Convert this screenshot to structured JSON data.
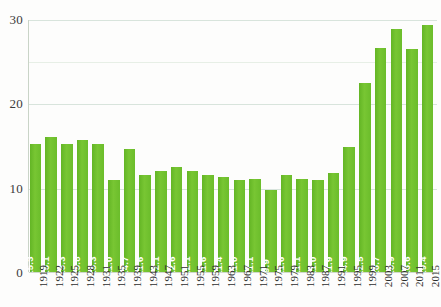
{
  "chart_data": {
    "type": "bar",
    "title": "",
    "xlabel": "",
    "ylabel": "",
    "ylim": [
      0,
      30
    ],
    "yticks": [
      0,
      10,
      20,
      30
    ],
    "ytick_labels": [
      "0",
      "10",
      "20",
      "30"
    ],
    "extra_gridlines": [
      25
    ],
    "grid": true,
    "legend": "none",
    "bar_color": "#6cbe2a",
    "bar_label_color": "#ffffff",
    "axis_text_color": "#2e2e2e",
    "categories": [
      "1919",
      "1922",
      "1925",
      "1928",
      "1931",
      "1935",
      "1939",
      "1943",
      "1947",
      "1951",
      "1955",
      "1959",
      "1963",
      "1967",
      "1971",
      "1975",
      "1979",
      "1983",
      "1987",
      "1991",
      "1995",
      "1999",
      "2003",
      "2007",
      "2011",
      "2015"
    ],
    "values": [
      15.3,
      16.1,
      15.3,
      15.8,
      15.3,
      11.0,
      14.7,
      11.6,
      12.1,
      12.6,
      12.1,
      11.6,
      11.4,
      11.0,
      11.1,
      9.9,
      11.6,
      11.1,
      11.0,
      11.9,
      14.9,
      22.5,
      26.7,
      28.9,
      26.6,
      29.4
    ],
    "value_labels": [
      "15.3",
      "16.1",
      "15.3",
      "15.8",
      "15.3",
      "11.0",
      "14.7",
      "11.6",
      "12.1",
      "12.6",
      "12.1",
      "11.6",
      "11.4",
      "11.0",
      "11.1",
      "9.9",
      "11.6",
      "11.1",
      "11.0",
      "11.9",
      "14.9",
      "22.5",
      "26.7",
      "28.9",
      "26.6",
      "29.4"
    ]
  }
}
